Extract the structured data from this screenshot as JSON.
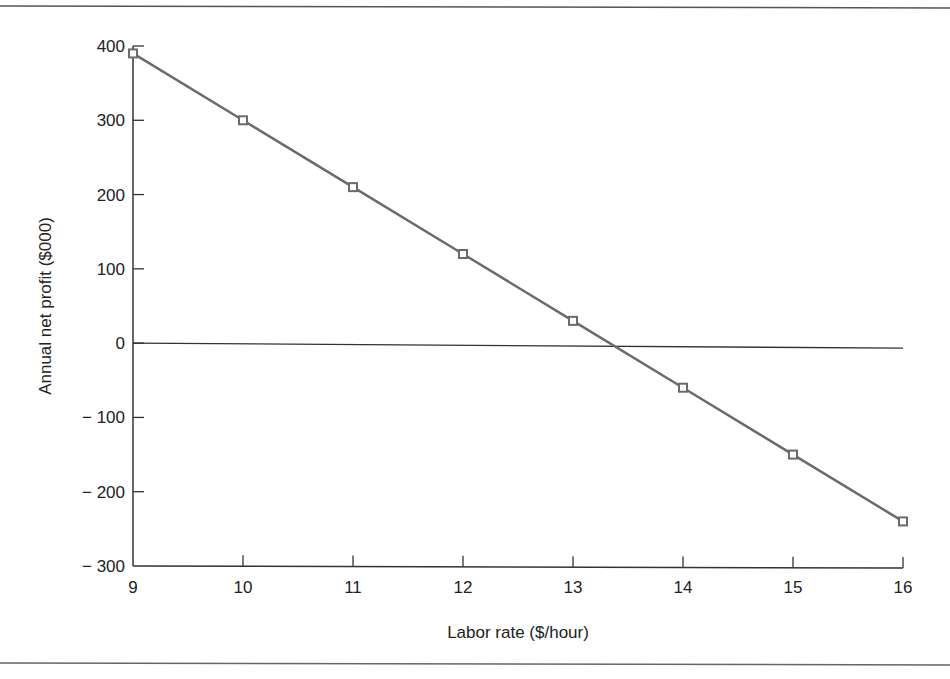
{
  "chart_data": {
    "type": "line",
    "title": "",
    "xlabel": "Labor rate ($/hour)",
    "ylabel": "Annual net profit ($000)",
    "x": [
      9,
      10,
      11,
      12,
      13,
      14,
      15,
      16
    ],
    "series": [
      {
        "name": "Annual net profit",
        "values": [
          390,
          300,
          210,
          120,
          30,
          -60,
          -150,
          -240
        ],
        "marker": "square",
        "color": "#6b6b6b"
      }
    ],
    "xlim": [
      9,
      16
    ],
    "ylim": [
      -300,
      400
    ],
    "x_ticks": [
      "9",
      "10",
      "11",
      "12",
      "13",
      "14",
      "15",
      "16"
    ],
    "y_ticks": [
      "400",
      "300",
      "200",
      "100",
      "0",
      "− 100",
      "− 200",
      "− 300"
    ],
    "reference_lines": [
      {
        "type": "horizontal",
        "y": 0
      }
    ],
    "grid": false,
    "legend": null
  },
  "colors": {
    "line": "#6b6b6b",
    "axis": "#333333",
    "rule": "#555555"
  }
}
